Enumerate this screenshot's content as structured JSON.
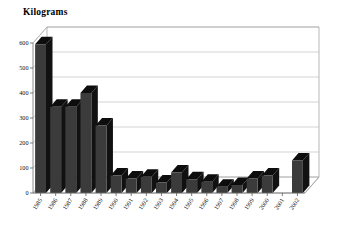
{
  "chart_data": {
    "type": "bar",
    "title": "Kilograms",
    "subtitle": "",
    "xlabel": "",
    "ylabel": "Kilograms",
    "ylim": [
      0,
      600
    ],
    "ytick_step": 100,
    "yticks": [
      "0",
      "100",
      "200",
      "300",
      "400",
      "500",
      "600"
    ],
    "grid": true,
    "legend": false,
    "legend_position": "none",
    "three_d": true,
    "bar_color": "#3b3b3b",
    "bar_top_color": "#0d0d0d",
    "bar_side_color": "#111111",
    "background_color": "#ffffff",
    "frame_color": "#9a9a9a",
    "categories": [
      "1985",
      "1986",
      "1987",
      "1988",
      "1989",
      "1990",
      "1991",
      "1992",
      "1993",
      "1994",
      "1995",
      "1996",
      "1997",
      "1998",
      "1999",
      "2000",
      "2001",
      "2002"
    ],
    "values": [
      595,
      345,
      345,
      400,
      270,
      70,
      58,
      65,
      42,
      82,
      55,
      45,
      25,
      32,
      58,
      70,
      0,
      130
    ],
    "annotations": []
  }
}
